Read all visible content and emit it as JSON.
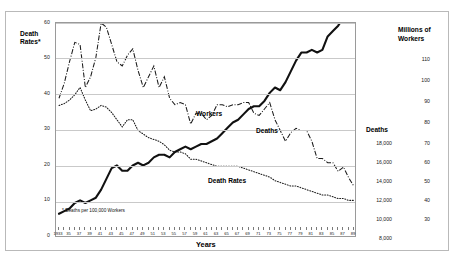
{
  "figure": {
    "footnote": "* Deaths per 100,000 Workers",
    "xaxis_title": "Years",
    "left_axis_title": "Death Rates*",
    "deaths_axis_title": "Deaths",
    "workers_axis_title": "Millions of Workers"
  },
  "series_labels": {
    "workers": "Workers",
    "deaths": "Deaths",
    "death_rates": "Death Rates"
  },
  "axes": {
    "left_ticks": [
      "60",
      "50",
      "40",
      "30",
      "20",
      "10",
      "0"
    ],
    "deaths_ticks": [
      "18,000",
      "16,000",
      "14,000",
      "12,000",
      "10,000",
      "8,000"
    ],
    "workers_ticks": [
      "110",
      "100",
      "90",
      "80",
      "70",
      "60",
      "50",
      "40",
      "30"
    ]
  },
  "chart_data": {
    "type": "line",
    "title": "",
    "subtitle": "",
    "xlabel": "Years",
    "ylabel": "Death Rates*",
    "grid": true,
    "legend": "inline-labels",
    "xlim": [
      1933,
      1989
    ],
    "x_tick_labels": [
      "1933",
      "35",
      "37",
      "39",
      "41",
      "43",
      "45",
      "47",
      "49",
      "51",
      "53",
      "55",
      "57",
      "59",
      "61",
      "63",
      "65",
      "67",
      "69",
      "71",
      "73",
      "75",
      "77",
      "79",
      "81",
      "83",
      "85",
      "87",
      "89"
    ],
    "x": [
      1933,
      1934,
      1935,
      1936,
      1937,
      1938,
      1939,
      1940,
      1941,
      1942,
      1943,
      1944,
      1945,
      1946,
      1947,
      1948,
      1949,
      1950,
      1951,
      1952,
      1953,
      1954,
      1955,
      1956,
      1957,
      1958,
      1959,
      1960,
      1961,
      1962,
      1963,
      1964,
      1965,
      1966,
      1967,
      1968,
      1969,
      1970,
      1971,
      1972,
      1973,
      1974,
      1975,
      1976,
      1977,
      1978,
      1979,
      1980,
      1981,
      1982,
      1983,
      1984,
      1985,
      1986,
      1987,
      1988,
      1989
    ],
    "axis_assignment": {
      "death_rates": "left (Death Rates*, 0-60)",
      "deaths": "right-inner (Deaths, 8,000-18,000)",
      "workers": "right-outer (Millions of Workers, 30-110)"
    },
    "series": [
      {
        "name": "Death Rates",
        "style": "dotted",
        "axis": "left",
        "ylim": [
          0,
          60
        ],
        "values": [
          37,
          37.5,
          38.5,
          40,
          42,
          38.5,
          35.5,
          36,
          37,
          36.5,
          35,
          33,
          31,
          33,
          33,
          30,
          29,
          28,
          27.5,
          27,
          26,
          24.5,
          24,
          24,
          23.5,
          22,
          22,
          21.5,
          21,
          20.5,
          20,
          20,
          20,
          20,
          20,
          19.5,
          19,
          18.5,
          18,
          17.5,
          17,
          16,
          15.5,
          15,
          14.5,
          14.5,
          14,
          13.5,
          13,
          12.5,
          12,
          12,
          11.5,
          11,
          11,
          10.5,
          10.5
        ]
      },
      {
        "name": "Deaths",
        "style": "dash-dot",
        "axis": "right-inner",
        "ylim": [
          8000,
          18000
        ],
        "values": [
          14500,
          15200,
          16200,
          17100,
          17000,
          15000,
          15500,
          16400,
          18000,
          17800,
          17000,
          16200,
          16000,
          16500,
          16800,
          15800,
          15000,
          15500,
          16000,
          15000,
          15500,
          14500,
          14200,
          14300,
          14200,
          13300,
          13800,
          13800,
          13500,
          13700,
          14200,
          14200,
          14100,
          14200,
          14200,
          14300,
          14300,
          13800,
          13700,
          14000,
          14300,
          13500,
          13000,
          12500,
          12900,
          13100,
          13000,
          13000,
          12500,
          11700,
          11700,
          11500,
          11500,
          11100,
          11300,
          10800,
          10400
        ]
      },
      {
        "name": "Workers",
        "style": "solid-thick",
        "axis": "right-outer",
        "ylim": [
          30,
          110
        ],
        "values": [
          39,
          40,
          41,
          43,
          44,
          43,
          44,
          45,
          48,
          52,
          56,
          57,
          55,
          55,
          57,
          58,
          57,
          58,
          60,
          61,
          61,
          60,
          62,
          63,
          64,
          63,
          64,
          65,
          65,
          66,
          67,
          69,
          71,
          73,
          74,
          76,
          78,
          79,
          79,
          81,
          84,
          86,
          85,
          88,
          92,
          96,
          99,
          99,
          100,
          99,
          100,
          105,
          107,
          109,
          112,
          114,
          116
        ]
      }
    ]
  }
}
